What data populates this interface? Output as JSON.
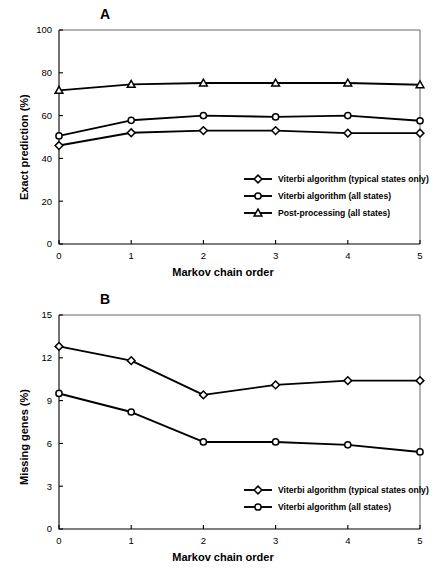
{
  "figure": {
    "panel_a_letter": "A",
    "panel_b_letter": "B"
  },
  "chart_data": [
    {
      "type": "line",
      "panel": "A",
      "title": "A",
      "xlabel": "Markov chain order",
      "ylabel": "Exact prediction (%)",
      "x": [
        0,
        1,
        2,
        3,
        4,
        5
      ],
      "xticklabels": [
        "0",
        "1",
        "2",
        "3",
        "4",
        "5"
      ],
      "yticklabels": [
        "0",
        "20",
        "40",
        "60",
        "80",
        "100"
      ],
      "yticks": [
        0,
        20,
        40,
        60,
        80,
        100
      ],
      "xlim": [
        0,
        5
      ],
      "ylim": [
        0,
        100
      ],
      "grid": false,
      "legend_position": "lower right inside",
      "series": [
        {
          "name": "Viterbi algorithm (typical states only)",
          "marker": "diamond",
          "values": [
            46.0,
            52.0,
            53.0,
            53.0,
            51.8,
            51.8
          ]
        },
        {
          "name": "Viterbi algorithm (all states)",
          "marker": "circle",
          "values": [
            50.5,
            57.8,
            60.0,
            59.4,
            60.0,
            57.6
          ]
        },
        {
          "name": "Post-processing (all states)",
          "marker": "triangle",
          "values": [
            71.8,
            74.6,
            75.2,
            75.2,
            75.2,
            74.4
          ]
        }
      ]
    },
    {
      "type": "line",
      "panel": "B",
      "title": "B",
      "xlabel": "Markov chain order",
      "ylabel": "Missing genes (%)",
      "x": [
        0,
        1,
        2,
        3,
        4,
        5
      ],
      "xticklabels": [
        "0",
        "1",
        "2",
        "3",
        "4",
        "5"
      ],
      "yticklabels": [
        "0",
        "3",
        "6",
        "9",
        "12",
        "15"
      ],
      "yticks": [
        0,
        3,
        6,
        9,
        12,
        15
      ],
      "xlim": [
        0,
        5
      ],
      "ylim": [
        0,
        15
      ],
      "grid": false,
      "legend_position": "lower right inside",
      "series": [
        {
          "name": "Viterbi algorithm (typical states only)",
          "marker": "diamond",
          "values": [
            12.8,
            11.8,
            9.4,
            10.1,
            10.4,
            10.4
          ]
        },
        {
          "name": "Viterbi algorithm (all states)",
          "marker": "circle",
          "values": [
            9.5,
            8.2,
            6.1,
            6.1,
            5.9,
            5.4
          ]
        }
      ]
    }
  ]
}
